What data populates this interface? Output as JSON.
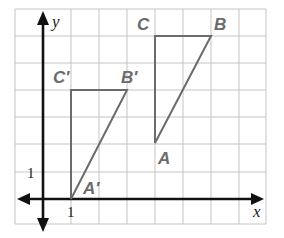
{
  "diagram": {
    "type": "coordinate-grid-translation",
    "axes": {
      "x_label": "x",
      "y_label": "y",
      "x_tick_label": "1",
      "y_tick_label": "1"
    },
    "grid": {
      "x_range": [
        -1,
        8
      ],
      "y_range": [
        -1,
        7
      ]
    },
    "colors": {
      "grid": "#c4c4c4",
      "axis": "#111111",
      "figure": "#6b6b6b"
    },
    "triangles": [
      {
        "name": "ABC",
        "vertices": [
          {
            "label": "A",
            "x": 4,
            "y": 2
          },
          {
            "label": "B",
            "x": 6,
            "y": 6
          },
          {
            "label": "C",
            "x": 4,
            "y": 6
          }
        ]
      },
      {
        "name": "A'B'C'",
        "vertices": [
          {
            "label": "A′",
            "x": 1,
            "y": 0
          },
          {
            "label": "B′",
            "x": 3,
            "y": 4
          },
          {
            "label": "C′",
            "x": 1,
            "y": 4
          }
        ]
      }
    ]
  }
}
